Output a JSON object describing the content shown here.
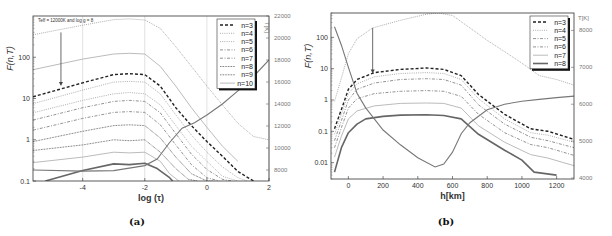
{
  "chart_data": [
    {
      "panel": "a",
      "type": "line",
      "caption": "(a)",
      "annotation": "T_eff = 12000K and log g = 8",
      "xlabel": "log (τ)",
      "ylabel": "F_i(n,T)",
      "ylabel_right": "T[K]",
      "xlim": [
        -5.6,
        2
      ],
      "ylim": [
        0.1,
        1000
      ],
      "yscale": "log",
      "ylim_right": [
        7000,
        22000
      ],
      "xticks": [
        -4,
        -2,
        0,
        2
      ],
      "yticks": [
        0.1,
        1,
        10,
        100
      ],
      "yticks_right": [
        8000,
        10000,
        12000,
        14000,
        16000,
        18000,
        20000,
        22000
      ],
      "grid": "vertical lines at x ticks",
      "legend_position": "upper right",
      "legend": [
        "n=3",
        "n=4",
        "n=5",
        "n=6",
        "n=7",
        "n=8",
        "n=9",
        "n=10"
      ],
      "series": [
        {
          "name": "n=3",
          "style": "dashed-bold",
          "x": [
            -5.6,
            -4,
            -3,
            -2.5,
            -2,
            -1.5,
            -1,
            -0.5,
            0,
            0.5,
            1,
            1.5
          ],
          "values": [
            11,
            24,
            38,
            40,
            38,
            20,
            6,
            2.2,
            0.9,
            0.4,
            0.17,
            0.1
          ]
        },
        {
          "name": "n=4",
          "style": "dotted",
          "x": [
            -5.6,
            -4,
            -3,
            -2.5,
            -2,
            -1.5,
            -1,
            -0.5,
            0,
            0.5,
            1,
            1.3
          ],
          "values": [
            7.5,
            16,
            25,
            26,
            25,
            13,
            4,
            1.3,
            0.5,
            0.22,
            0.12,
            0.1
          ]
        },
        {
          "name": "n=5",
          "style": "dotted",
          "x": [
            -5.6,
            -4,
            -3,
            -2.5,
            -2,
            -1.5,
            -1,
            -0.5,
            0,
            0.5,
            1
          ],
          "values": [
            4.5,
            9,
            13,
            14,
            13,
            7,
            2.2,
            0.7,
            0.3,
            0.13,
            0.1
          ]
        },
        {
          "name": "n=6",
          "style": "dash-dot",
          "x": [
            -5.6,
            -4,
            -3,
            -2.5,
            -2,
            -1.5,
            -1,
            -0.5,
            0,
            0.5,
            0.8
          ],
          "values": [
            3,
            6,
            8.5,
            9,
            8.5,
            4.5,
            1.4,
            0.45,
            0.19,
            0.11,
            0.1
          ]
        },
        {
          "name": "n=7",
          "style": "dash-dot",
          "x": [
            -5.6,
            -4,
            -3,
            -2.5,
            -2,
            -1.5,
            -1,
            -0.5,
            0,
            0.4
          ],
          "values": [
            1.7,
            3.3,
            4.6,
            4.8,
            4.6,
            2.3,
            0.75,
            0.25,
            0.12,
            0.1
          ]
        },
        {
          "name": "n=8",
          "style": "dotted-dense",
          "x": [
            -5.6,
            -4,
            -3,
            -2.5,
            -2,
            -1.5,
            -1,
            -0.5,
            0,
            0.2
          ],
          "values": [
            0.9,
            1.6,
            2.2,
            2.3,
            2.2,
            1.1,
            0.38,
            0.15,
            0.1,
            0.1
          ]
        },
        {
          "name": "n=9",
          "style": "dotted-dense",
          "x": [
            -5.6,
            -4,
            -3,
            -2.5,
            -2,
            -1.5,
            -1,
            -0.6,
            -0.3
          ],
          "values": [
            0.55,
            0.75,
            1.0,
            0.95,
            1.0,
            0.5,
            0.2,
            0.11,
            0.1
          ]
        },
        {
          "name": "n=10",
          "style": "solid-light",
          "x": [
            -5.6,
            -4,
            -3,
            -2.5,
            -2,
            -1.5,
            -1.2,
            -0.9
          ],
          "values": [
            0.28,
            0.38,
            0.5,
            0.48,
            0.5,
            0.3,
            0.15,
            0.1
          ]
        },
        {
          "name": "n=11 (unlabeled)",
          "style": "solid-thick",
          "x": [
            -5.2,
            -4,
            -3,
            -2.5,
            -2,
            -1.6,
            -1.2,
            -1.1
          ],
          "values": [
            0.1,
            0.18,
            0.26,
            0.25,
            0.27,
            0.2,
            0.12,
            0.1
          ]
        },
        {
          "name": "F upper (unlabeled)",
          "style": "dotted-top",
          "x": [
            -5.6,
            -4,
            -3,
            -2.5,
            -2,
            -1.5,
            -1,
            -0.5,
            0,
            0.5,
            1,
            1.5,
            2
          ],
          "values": [
            350,
            600,
            820,
            850,
            800,
            500,
            180,
            60,
            20,
            7,
            2.5,
            1.2,
            1.0
          ]
        },
        {
          "name": "upper n=? (unlabeled)",
          "style": "solid-light",
          "x": [
            -5.6,
            -4,
            -3,
            -2.5,
            -2,
            -1.5,
            -1,
            -0.5,
            0,
            0.5,
            1
          ],
          "values": [
            50,
            90,
            120,
            125,
            120,
            60,
            20,
            6,
            2,
            0.7,
            0.3
          ]
        }
      ],
      "temperature_series": {
        "name": "T",
        "axis": "right",
        "x": [
          -5.6,
          -4,
          -3,
          -2,
          -1.6,
          -1.2,
          -0.8,
          -0.4,
          0,
          0.5,
          1,
          1.5,
          2
        ],
        "values": [
          8000,
          7900,
          7950,
          8400,
          9000,
          10500,
          11800,
          12300,
          13000,
          14000,
          15200,
          16500,
          18000
        ]
      },
      "arrow": {
        "x": -4.7,
        "from": 400,
        "to": 20
      }
    },
    {
      "panel": "b",
      "type": "line",
      "caption": "(b)",
      "xlabel": "h[km]",
      "ylabel": "F_i(n,T)",
      "ylabel_right": "T[K]",
      "xlim": [
        -100,
        1300
      ],
      "ylim": [
        0.003,
        600
      ],
      "yscale": "log",
      "ylim_right": [
        4000,
        8500
      ],
      "xticks": [
        0,
        200,
        400,
        600,
        800,
        1000,
        1200
      ],
      "yticks": [
        0.01,
        0.1,
        1,
        10,
        100
      ],
      "yticks_right": [
        4000,
        5000,
        6000,
        7000,
        8000
      ],
      "grid": "none",
      "legend_position": "upper right",
      "legend": [
        "n=3",
        "n=4",
        "n=5",
        "n=6",
        "n=7",
        "n=8"
      ],
      "series": [
        {
          "name": "n=3",
          "style": "dashed-bold",
          "x": [
            -80,
            -40,
            0,
            50,
            150,
            300,
            450,
            550,
            650,
            750,
            900,
            1050,
            1150,
            1300
          ],
          "values": [
            0.12,
            0.5,
            2.2,
            4.5,
            7.5,
            9.5,
            10.5,
            9.5,
            6,
            1.5,
            0.35,
            0.12,
            0.1,
            0.055
          ]
        },
        {
          "name": "n=4",
          "style": "dotted",
          "x": [
            -80,
            -40,
            0,
            50,
            150,
            300,
            450,
            550,
            650,
            750,
            900,
            1050,
            1150,
            1300
          ],
          "values": [
            0.08,
            0.35,
            1.6,
            3.3,
            5.5,
            7,
            7.5,
            7,
            4.5,
            1.1,
            0.25,
            0.09,
            0.075,
            0.045
          ]
        },
        {
          "name": "n=5",
          "style": "dash-dot",
          "x": [
            -80,
            -40,
            0,
            50,
            150,
            300,
            450,
            550,
            650,
            750,
            900,
            1050,
            1150,
            1300
          ],
          "values": [
            0.05,
            0.22,
            1.0,
            2.2,
            3.5,
            4.5,
            4.8,
            4.5,
            3,
            0.7,
            0.17,
            0.065,
            0.05,
            0.03
          ]
        },
        {
          "name": "n=6",
          "style": "dash-dot",
          "x": [
            -80,
            -40,
            0,
            50,
            150,
            300,
            450,
            550,
            650,
            750,
            900,
            1050,
            1150,
            1300
          ],
          "values": [
            0.03,
            0.13,
            0.55,
            1.1,
            1.6,
            1.9,
            2.0,
            1.9,
            1.3,
            0.35,
            0.09,
            0.038,
            0.03,
            0.017
          ]
        },
        {
          "name": "n=7",
          "style": "solid-light",
          "x": [
            -80,
            -40,
            0,
            50,
            150,
            300,
            450,
            550,
            650,
            750,
            900,
            1050,
            1150,
            1300
          ],
          "values": [
            0.015,
            0.07,
            0.25,
            0.45,
            0.65,
            0.78,
            0.8,
            0.78,
            0.55,
            0.15,
            0.045,
            0.018,
            0.014,
            0.008
          ]
        },
        {
          "name": "n=8",
          "style": "solid-thick",
          "x": [
            -80,
            -40,
            0,
            50,
            100,
            200,
            300,
            450,
            550,
            650,
            750,
            900,
            1000,
            1070,
            1200
          ],
          "values": [
            0.005,
            0.03,
            0.09,
            0.17,
            0.25,
            0.3,
            0.33,
            0.34,
            0.32,
            0.25,
            0.08,
            0.025,
            0.012,
            0.005,
            0.004
          ]
        }
      ],
      "temperature_series": {
        "name": "T",
        "axis": "right",
        "x": [
          -80,
          -40,
          0,
          50,
          100,
          200,
          300,
          400,
          500,
          550,
          600,
          650,
          700,
          800,
          900,
          1000,
          1100,
          1200,
          1300
        ],
        "values": [
          8100,
          7600,
          7000,
          6300,
          5900,
          5300,
          4900,
          4550,
          4300,
          4380,
          4700,
          5200,
          5500,
          5850,
          6000,
          6080,
          6130,
          6180,
          6220
        ]
      },
      "upper_series": {
        "name": "F upper (unlabeled)",
        "style": "dotted-top",
        "x": [
          -80,
          -40,
          0,
          50,
          140,
          300,
          450,
          520,
          600,
          700,
          800,
          900,
          1000,
          1100,
          1200,
          1300
        ],
        "values": [
          0.9,
          5,
          30,
          90,
          200,
          350,
          550,
          600,
          500,
          200,
          80,
          35,
          15,
          6,
          4.5,
          3
        ]
      },
      "arrow": {
        "x": 140,
        "from": 200,
        "to": 7
      }
    }
  ],
  "figure": {
    "caption_a": "(a)",
    "caption_b": "(b)"
  }
}
